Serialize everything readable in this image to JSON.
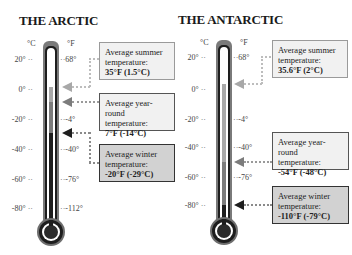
{
  "arctic": {
    "title": "THE ARCTIC",
    "unit_c": "°C",
    "unit_f": "°F",
    "ticks": [
      {
        "c": "20°",
        "f": "68°"
      },
      {
        "c": "0°",
        "f": ""
      },
      {
        "c": "-20°",
        "f": "-4°"
      },
      {
        "c": "-40°",
        "f": "-40°"
      },
      {
        "c": "-60°",
        "f": "-76°"
      },
      {
        "c": "-80°",
        "f": "-112°"
      }
    ],
    "callouts": {
      "summer": {
        "line1": "Average summer",
        "line2": "temperature:",
        "value": "35°F (1.5°C)"
      },
      "yearround": {
        "line1": "Average year-round",
        "line2": "temperature:",
        "value": "7°F (-14°C)"
      },
      "winter": {
        "line1": "Average winter",
        "line2": "temperature:",
        "value": "-20°F (-29°C)"
      }
    }
  },
  "antarctic": {
    "title": "THE ANTARCTIC",
    "unit_c": "°C",
    "unit_f": "°F",
    "ticks": [
      {
        "c": "20°",
        "f": "68°"
      },
      {
        "c": "0°",
        "f": ""
      },
      {
        "c": "-20°",
        "f": "-4°"
      },
      {
        "c": "-40°",
        "f": "-40°"
      },
      {
        "c": "-60°",
        "f": "-76°"
      },
      {
        "c": "-80°",
        "f": ""
      }
    ],
    "callouts": {
      "summer": {
        "line1": "Average summer",
        "line2": "temperature:",
        "value": "35.6°F (2°C)"
      },
      "yearround": {
        "line1": "Average year-round",
        "line2": "temperature:",
        "value": "-54°F (-48°C)"
      },
      "winter": {
        "line1": "Average winter",
        "line2": "temperature:",
        "value": "-110°F (-79°C)"
      }
    }
  },
  "colors": {
    "summer": "#a8a8a8",
    "yearround": "#7c7c7c",
    "winter": "#1e1e1e",
    "box_light": "#f1f1f1",
    "box_dark": "#d2d2d2"
  }
}
